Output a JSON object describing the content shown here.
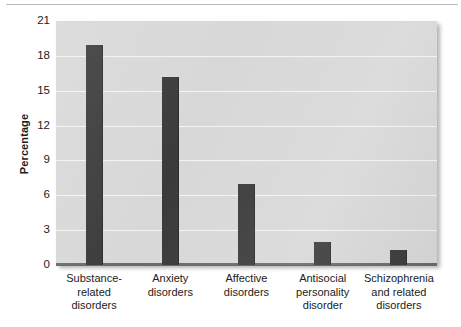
{
  "chart_data": {
    "type": "bar",
    "title": "",
    "subtitle": "",
    "xlabel": "",
    "ylabel": "Percentage",
    "ylim": [
      0,
      21
    ],
    "yticks": [
      0,
      3,
      6,
      9,
      12,
      15,
      18,
      21
    ],
    "ytick_labels": [
      "0",
      "3",
      "6",
      "9",
      "12",
      "15",
      "18",
      "21"
    ],
    "grid": true,
    "legend": null,
    "bar_color": "#3a3a3a",
    "plot_background": "#d8d8d8",
    "gridline_color": "#f4f4f4",
    "categories": [
      "Substance-related disorders",
      "Anxiety disorders",
      "Affective disorders",
      "Antisocial personality disorder",
      "Schizophrenia and related disorders"
    ],
    "category_lines": [
      [
        "Substance-",
        "related",
        "disorders"
      ],
      [
        "Anxiety",
        "disorders"
      ],
      [
        "Affective",
        "disorders"
      ],
      [
        "Antisocial",
        "personality",
        "disorder"
      ],
      [
        "Schizophrenia",
        "and related",
        "disorders"
      ]
    ],
    "values": [
      18.9,
      16.2,
      7.0,
      2.0,
      1.3
    ]
  }
}
